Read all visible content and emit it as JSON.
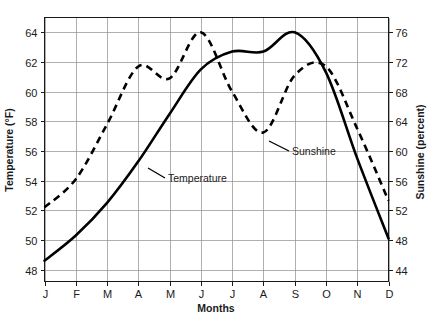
{
  "chart_data": {
    "type": "line",
    "title": "",
    "xlabel": "Months",
    "categories": [
      "J",
      "F",
      "M",
      "A",
      "M",
      "J",
      "J",
      "A",
      "S",
      "O",
      "N",
      "D"
    ],
    "category_names": [
      "January",
      "February",
      "March",
      "April",
      "May",
      "June",
      "July",
      "August",
      "September",
      "October",
      "November",
      "December"
    ],
    "grid": true,
    "legend_position": "inline-annotations",
    "axes": {
      "left": {
        "label": "Temperature (°F)",
        "ticks": [
          48,
          50,
          52,
          54,
          56,
          58,
          60,
          62,
          64
        ],
        "range": [
          47.2,
          65.0
        ],
        "units": "°F"
      },
      "right": {
        "label": "Sunshine (percent)",
        "ticks": [
          44,
          48,
          52,
          56,
          60,
          64,
          68,
          72,
          76
        ],
        "range": [
          42.4,
          78.0
        ],
        "units": "percent"
      },
      "x": {
        "label": "Months",
        "ticks": [
          "J",
          "F",
          "M",
          "A",
          "M",
          "J",
          "J",
          "A",
          "S",
          "O",
          "N",
          "D"
        ]
      }
    },
    "series": [
      {
        "name": "Temperature",
        "axis": "left",
        "style": "solid",
        "color": "#000000",
        "label_text": "Temperature",
        "values": [
          48.6,
          50.3,
          52.5,
          55.3,
          58.5,
          61.5,
          62.7,
          62.7,
          64.0,
          61.3,
          55.5,
          50.1
        ]
      },
      {
        "name": "Sunshine",
        "axis": "right",
        "style": "dashed",
        "color": "#000000",
        "label_text": "Sunshine",
        "values": [
          52.4,
          56.2,
          63.6,
          71.4,
          69.8,
          76.0,
          68.0,
          62.5,
          70.2,
          71.4,
          63.0,
          53.3
        ]
      }
    ]
  },
  "annotations": {
    "temperature_label": "Temperature",
    "sunshine_label": "Sunshine"
  },
  "axis_titles": {
    "left": "Temperature (°F)",
    "right": "Sunshine (percent)",
    "bottom": "Months"
  },
  "tick_labels": {
    "left": [
      "64",
      "62",
      "60",
      "58",
      "56",
      "54",
      "52",
      "50",
      "48"
    ],
    "right": [
      "76",
      "72",
      "68",
      "64",
      "60",
      "56",
      "52",
      "48",
      "44"
    ],
    "bottom": [
      "J",
      "F",
      "M",
      "A",
      "M",
      "J",
      "J",
      "A",
      "S",
      "O",
      "N",
      "D"
    ]
  },
  "colors": {
    "ink": "#000000",
    "grid": "#8d8d8d",
    "background": "#ffffff"
  }
}
